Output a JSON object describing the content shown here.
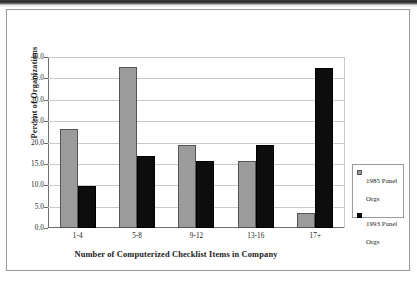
{
  "chart_data": {
    "type": "bar",
    "title": "",
    "xlabel": "Number of Computerized Checklist Items in Company",
    "ylabel": "Percent of Organizations",
    "categories": [
      "1-4",
      "5-8",
      "9-12",
      "13-16",
      "17+"
    ],
    "series": [
      {
        "name": "1985 Panel Orgs",
        "color": "#9b9b9b",
        "values": [
          23.1,
          37.7,
          19.5,
          15.6,
          3.4
        ]
      },
      {
        "name": "1993 Panel Orgs",
        "color": "#0d0d0d",
        "values": [
          9.8,
          16.9,
          15.6,
          19.5,
          37.4
        ]
      }
    ],
    "ylim": [
      0.0,
      40.0
    ],
    "ytick_step": 5.0,
    "ytick_labels": [
      "40.0",
      "35.0",
      "30.0",
      "25.0",
      "20.0",
      "15.0",
      "10.0",
      "5.0",
      "0.0"
    ],
    "ytick_values": [
      40.0,
      35.0,
      30.0,
      25.0,
      20.0,
      15.0,
      10.0,
      5.0,
      0.0
    ],
    "grid": true,
    "grid_axis": "y",
    "legend_position": "right"
  },
  "legend": {
    "items": [
      {
        "label": "1985 Panel Orgs"
      },
      {
        "label": "1993 Panel Orgs"
      }
    ]
  }
}
